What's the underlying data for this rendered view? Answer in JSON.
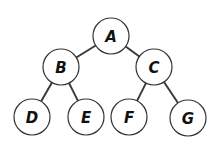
{
  "diagram": {
    "type": "binary-tree",
    "nodes": [
      {
        "id": "A",
        "label": "A",
        "cx": 111,
        "cy": 36
      },
      {
        "id": "B",
        "label": "B",
        "cx": 61,
        "cy": 67
      },
      {
        "id": "C",
        "label": "C",
        "cx": 154,
        "cy": 67
      },
      {
        "id": "D",
        "label": "D",
        "cx": 32,
        "cy": 117
      },
      {
        "id": "E",
        "label": "E",
        "cx": 86,
        "cy": 117
      },
      {
        "id": "F",
        "label": "F",
        "cx": 129,
        "cy": 117
      },
      {
        "id": "G",
        "label": "G",
        "cx": 188,
        "cy": 118
      }
    ],
    "edges": [
      {
        "from": "A",
        "to": "B"
      },
      {
        "from": "A",
        "to": "C"
      },
      {
        "from": "B",
        "to": "D"
      },
      {
        "from": "B",
        "to": "E"
      },
      {
        "from": "C",
        "to": "F"
      },
      {
        "from": "C",
        "to": "G"
      }
    ],
    "node_radius": 18
  }
}
